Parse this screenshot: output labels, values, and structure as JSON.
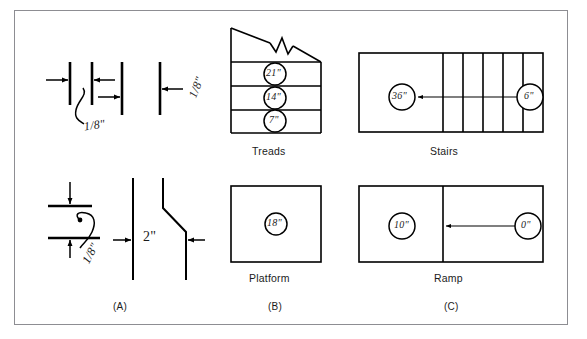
{
  "figure": {
    "title": "",
    "background_color": "#ffffff",
    "line_color": "#000000",
    "frame_color": "#8d8d92"
  },
  "panels": [
    {
      "id": "panel-a",
      "caption": "(A)",
      "subject": "tolerance-dimension-details",
      "details": [
        {
          "id": "detail-a-top-left",
          "dimension_label": "1/8\"",
          "leader": "curved",
          "bars": 3,
          "orientation": "vertical"
        },
        {
          "id": "detail-a-top-right",
          "dimension_label": "1/8\"",
          "leader": "straight",
          "bars": 1,
          "orientation": "vertical"
        },
        {
          "id": "detail-a-bottom-left",
          "dimension_label": "1/8\"",
          "leader": "curved",
          "bars": 2,
          "orientation": "horizontal"
        },
        {
          "id": "detail-a-bottom-right",
          "dimension_label": "2\"",
          "leader": "straight",
          "bars": 2,
          "orientation": "vertical",
          "feature": "offset-jog"
        }
      ]
    },
    {
      "id": "panel-b",
      "caption": "(B)",
      "diagrams": [
        {
          "id": "treads",
          "label": "Treads",
          "shape": "stepped-trapezoid-with-break",
          "callouts": [
            {
              "value": "21\""
            },
            {
              "value": "14\""
            },
            {
              "value": "7\""
            }
          ]
        },
        {
          "id": "platform",
          "label": "Platform",
          "shape": "square",
          "callouts": [
            {
              "value": "18\""
            }
          ]
        }
      ]
    },
    {
      "id": "panel-c",
      "caption": "(C)",
      "diagrams": [
        {
          "id": "stairs",
          "label": "Stairs",
          "shape": "rectangle-with-treads",
          "tread_lines": 5,
          "callouts": [
            {
              "value": "36\"",
              "position": "left"
            },
            {
              "value": "6\"",
              "position": "right"
            }
          ],
          "arrow": "right-to-left"
        },
        {
          "id": "ramp",
          "label": "Ramp",
          "shape": "rectangle-split",
          "callouts": [
            {
              "value": "10\"",
              "position": "left"
            },
            {
              "value": "0\"",
              "position": "right"
            }
          ],
          "arrow": "right-to-left"
        }
      ]
    }
  ],
  "labels": {
    "treads": "Treads",
    "stairs": "Stairs",
    "platform": "Platform",
    "ramp": "Ramp",
    "cap_a": "(A)",
    "cap_b": "(B)",
    "cap_c": "(C)",
    "dim_eighth_1": "1/8\"",
    "dim_eighth_2": "1/8\"",
    "dim_eighth_3": "1/8\"",
    "dim_two_inch": "2\"",
    "tread_21": "21\"",
    "tread_14": "14\"",
    "tread_7": "7\"",
    "platform_18": "18\"",
    "stairs_left": "36\"",
    "stairs_right": "6\"",
    "ramp_left": "10\"",
    "ramp_right": "0\""
  }
}
